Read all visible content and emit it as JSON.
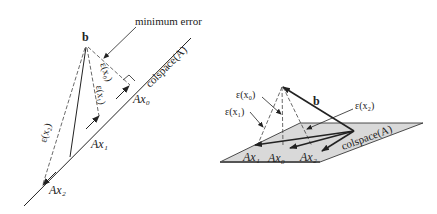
{
  "left_panel": {
    "b_label": "b",
    "annotation": "minimum error",
    "colspace_label": "colspace(A)",
    "error_labels": [
      "ε(x₀)",
      "ε(x₁)",
      "ε(x₂)"
    ],
    "point_labels": [
      "Ax₀",
      "Ax₁",
      "Ax₂"
    ]
  },
  "right_panel": {
    "b_label": "b",
    "colspace_label": "colspace(A)",
    "error_labels": [
      "ε(x₀)",
      "ε(x₁)",
      "ε(x₂)"
    ],
    "point_labels": [
      "Ax₁",
      "Ax₀",
      "Ax₂"
    ]
  },
  "colors": {
    "line": "#222222",
    "plane_fill": "#d9d9d9"
  }
}
